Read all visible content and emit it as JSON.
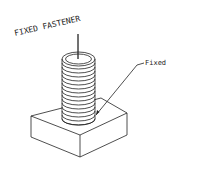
{
  "diagram": {
    "title": "FIXED FASTENER",
    "callout_label": "Fixed",
    "parts": [
      "threaded-stud",
      "square-base-block"
    ],
    "colors": {
      "line": "#222222",
      "background": "#ffffff"
    }
  }
}
